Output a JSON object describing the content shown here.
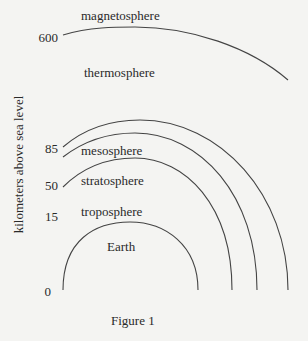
{
  "figure": {
    "caption": "Figure 1",
    "y_axis_label": "kilometers above sea level",
    "ticks": [
      "600",
      "85",
      "50",
      "15",
      "0"
    ],
    "layers": [
      {
        "name": "magnetosphere",
        "boundary_km": null
      },
      {
        "name": "thermosphere",
        "boundary_km": 600
      },
      {
        "name": "mesosphere",
        "boundary_km": 85
      },
      {
        "name": "stratosphere",
        "boundary_km": 50
      },
      {
        "name": "troposphere",
        "boundary_km": 15
      },
      {
        "name": "Earth",
        "boundary_km": 0
      }
    ],
    "line_color": "#444444",
    "background": "#f4f4f2"
  }
}
